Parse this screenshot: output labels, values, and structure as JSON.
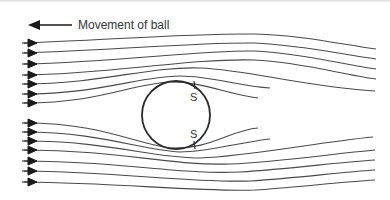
{
  "diagram": {
    "legend": {
      "label": "Movement of ball",
      "arrow_direction": "left"
    },
    "separation_points": [
      {
        "label": "S",
        "position": "upper-right"
      },
      {
        "label": "S",
        "position": "lower-right"
      }
    ],
    "streamlines": {
      "upper_count": 7,
      "lower_count": 7,
      "flow_direction": "right"
    },
    "ball": {
      "shape": "circle"
    },
    "colors": {
      "line": "#4a4a4a",
      "arrow": "#1a1a1a",
      "text": "#333333",
      "background": "#ffffff"
    }
  }
}
